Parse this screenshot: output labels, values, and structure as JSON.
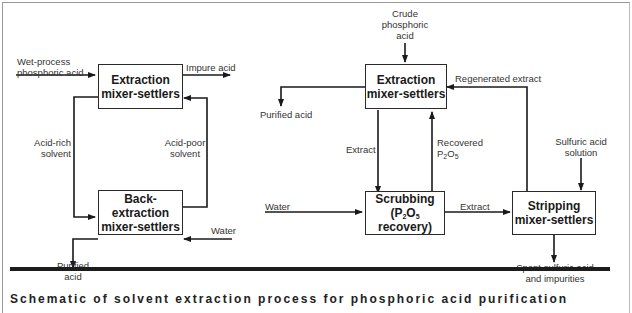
{
  "left_diagram": {
    "boxes": {
      "extraction": [
        "Extraction",
        "mixer-settlers"
      ],
      "back_extraction": [
        "Back-extraction",
        "mixer-settlers"
      ]
    },
    "labels": {
      "feed_line1": "Wet-process",
      "feed_line2": "phosphoric acid",
      "impure_acid": "Impure acid",
      "acid_rich_line1": "Acid-rich",
      "acid_rich_line2": "solvent",
      "acid_poor_line1": "Acid-poor",
      "acid_poor_line2": "solvent",
      "water": "Water",
      "purified_line1": "Purified",
      "purified_line2": "acid"
    }
  },
  "right_diagram": {
    "boxes": {
      "extraction": [
        "Extraction",
        "mixer-settlers"
      ],
      "scrubbing_line1": "Scrubbing",
      "scrubbing_line2_pre": "(P",
      "scrubbing_sub1": "2",
      "scrubbing_mid": "O",
      "scrubbing_sub2": "5",
      "scrubbing_post": " recovery)",
      "stripping": [
        "Stripping",
        "mixer-settlers"
      ]
    },
    "labels": {
      "crude_line1": "Crude",
      "crude_line2": "phosphoric",
      "crude_line3": "acid",
      "purified_acid": "Purified acid",
      "regenerated_extract": "Regenerated extract",
      "extract_down": "Extract",
      "recovered_line1": "Recovered",
      "recovered_p": "P",
      "recovered_sub1": "2",
      "recovered_o": "O",
      "recovered_sub2": "5",
      "water": "Water",
      "extract_right": "Extract",
      "sulfuric_line1": "Sulfuric acid",
      "sulfuric_line2": "solution",
      "spent_line1": "Spent sulfuric acid",
      "spent_line2": "and impurities"
    }
  },
  "caption": "Schematic of solvent extraction process for phosphoric acid purification"
}
